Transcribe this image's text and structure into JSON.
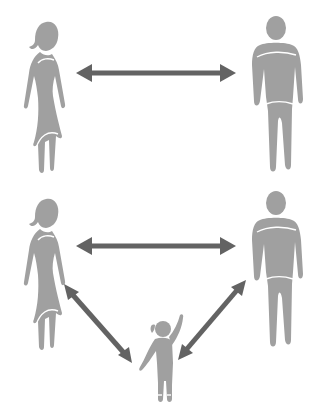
{
  "diagram": {
    "type": "relationship-diagram",
    "colors": {
      "figure": "#a0a0a0",
      "arrow": "#636363",
      "background": "#ffffff"
    },
    "top_group": {
      "nodes": [
        {
          "id": "woman",
          "label": "woman-icon"
        },
        {
          "id": "man",
          "label": "man-icon"
        }
      ],
      "edges": [
        {
          "from": "woman",
          "to": "man",
          "type": "bidirectional"
        }
      ]
    },
    "bottom_group": {
      "nodes": [
        {
          "id": "woman",
          "label": "woman-icon"
        },
        {
          "id": "man",
          "label": "man-icon"
        },
        {
          "id": "child",
          "label": "child-icon"
        }
      ],
      "edges": [
        {
          "from": "woman",
          "to": "man",
          "type": "bidirectional"
        },
        {
          "from": "woman",
          "to": "child",
          "type": "bidirectional"
        },
        {
          "from": "man",
          "to": "child",
          "type": "bidirectional"
        }
      ]
    }
  }
}
